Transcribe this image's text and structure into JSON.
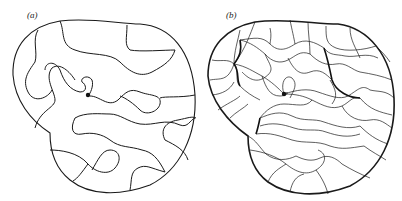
{
  "figure": {
    "panels": [
      {
        "id": "a",
        "label": "(a)",
        "description": "Single meandering curves filling a peanut-shaped domain, with a central spiral point"
      },
      {
        "id": "b",
        "label": "(b)",
        "description": "Dense network of curves meeting at nodes inside the same peanut-shaped domain, with central point"
      }
    ],
    "colors": {
      "line": "#1a1a1a",
      "background": "#ffffff"
    }
  }
}
